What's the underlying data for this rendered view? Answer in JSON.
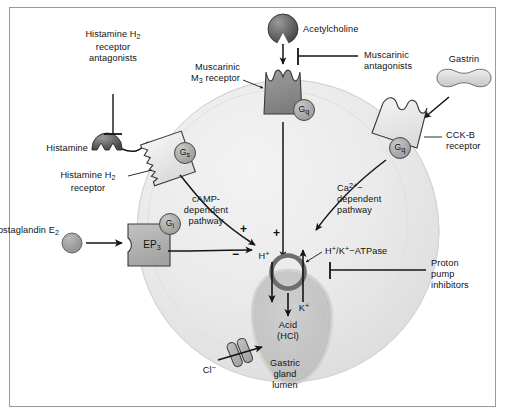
{
  "figure": {
    "domain": "biology-pathway-diagram"
  },
  "cell": {
    "lumen_label_lines": [
      "Gastric",
      "gland",
      "lumen"
    ],
    "acid_label_lines": [
      "Acid",
      "(HCl)"
    ]
  },
  "ligands": {
    "histamine": "Histamine",
    "acetylcholine": "Acetylcholine",
    "gastrin": "Gastrin",
    "prostaglandin": "Prostaglandin E",
    "prostaglandin_sub": "2"
  },
  "receptors": {
    "h2_line1": "Histamine H",
    "h2_sub": "2",
    "h2_line2": "receptor",
    "m3_line1": "Muscarinic",
    "m3_line2_pre": "M",
    "m3_line2_sub": "3",
    "m3_line2_post": " receptor",
    "cckb_line1": "CCK-B",
    "cckb_line2": "receptor",
    "ep3": "EP",
    "ep3_sub": "3"
  },
  "g_proteins": {
    "gs_main": "G",
    "gs_sub": "s",
    "gq_main": "G",
    "gq_sub": "q",
    "gi_main": "G",
    "gi_sub": "i"
  },
  "drugs": {
    "h2_antagonists": [
      "Histamine H",
      "receptor",
      "antagonists"
    ],
    "h2_antagonists_sub": "2",
    "muscarinic_antagonists": [
      "Muscarinic",
      "antagonists"
    ],
    "ppi": [
      "Proton",
      "pump",
      "inhibitors"
    ]
  },
  "pathways": {
    "camp": [
      "cAMP-",
      "dependent",
      "pathway"
    ],
    "calcium_pre": "Ca",
    "calcium_sup": "2+",
    "calcium_post": "−",
    "calcium_rest": [
      "dependent",
      "pathway"
    ]
  },
  "ions": {
    "proton_main": "H",
    "proton_sup": "+",
    "potassium_main": "K",
    "potassium_sup": "+",
    "chloride_main": "Cl",
    "chloride_sup": "−"
  },
  "pump": {
    "label_h": "H",
    "label_h_sup": "+",
    "label_slash": "/K",
    "label_k_sup": "+",
    "label_tail": "−ATPase"
  },
  "signs": {
    "plus_camp": "+",
    "plus_center": "+",
    "minus_ep3": "−"
  },
  "colors": {
    "frame_border": "#9a9a9a",
    "cell_fill_light": "#ececec",
    "cell_fill_mid": "#e2e2e2",
    "cell_edge": "#c9c9c9",
    "lumen_fill": "#c4c4c4",
    "lumen_edge": "#d8d8d8",
    "receptor_dark": "#8a8a8a",
    "receptor_light": "#e8e8e8",
    "receptor_mid": "#b0b0b0",
    "ligand_dark": "#5a5a5a",
    "ligand_light": "#d9d9d9",
    "stroke": "#1a1a1a",
    "text": "#111111"
  }
}
